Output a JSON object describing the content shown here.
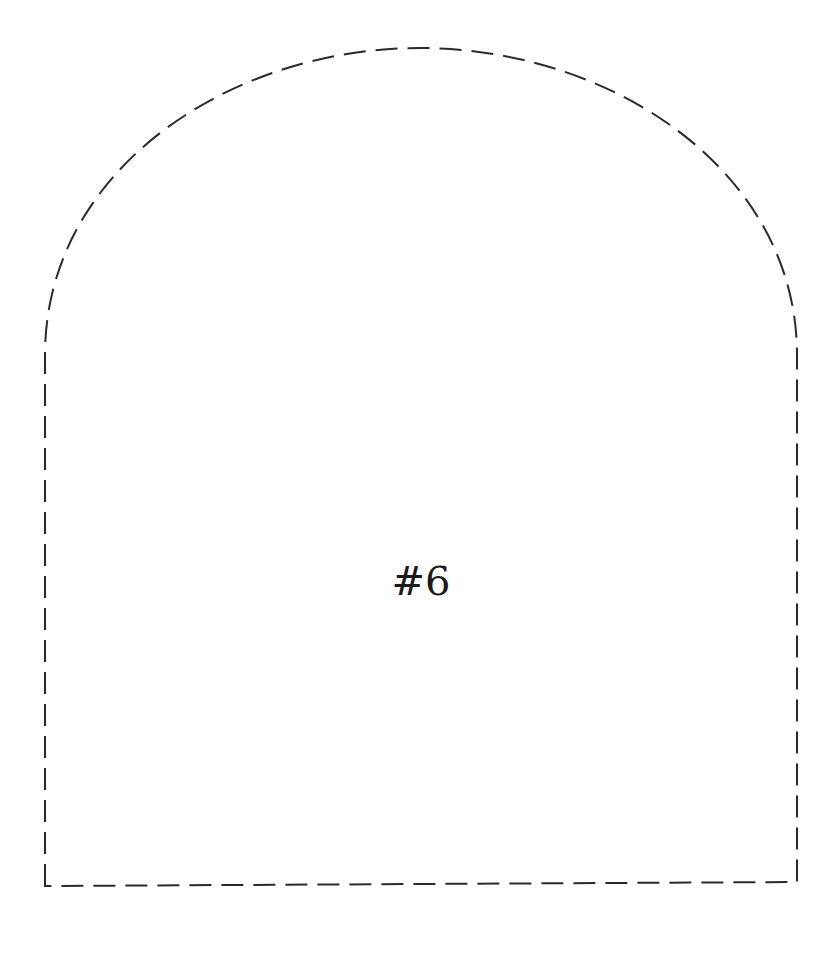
{
  "shape": {
    "type": "arch-window-outline",
    "stroke_color": "#2a2a2a",
    "stroke_style": "dashed",
    "fill": "#ffffff"
  },
  "label": {
    "text": "#6"
  }
}
